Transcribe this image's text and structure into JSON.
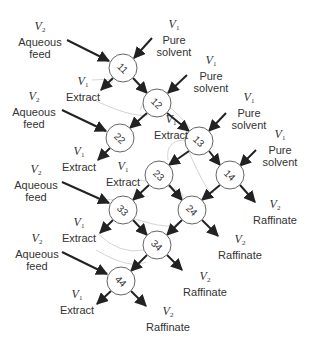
{
  "diagram": {
    "type": "cross-current extraction cascade",
    "colors": {
      "arrow": "#222222",
      "node_stroke": "#666666",
      "curve": "#cccccc",
      "text": "#333333"
    },
    "nodes": [
      {
        "id": "11",
        "label": "11",
        "x": 123,
        "y": 68
      },
      {
        "id": "12",
        "label": "12",
        "x": 157,
        "y": 103
      },
      {
        "id": "13",
        "label": "13",
        "x": 199,
        "y": 141
      },
      {
        "id": "14",
        "label": "14",
        "x": 230,
        "y": 175
      },
      {
        "id": "22",
        "label": "22",
        "x": 120,
        "y": 138
      },
      {
        "id": "23",
        "label": "23",
        "x": 159,
        "y": 175
      },
      {
        "id": "24",
        "label": "24",
        "x": 192,
        "y": 210
      },
      {
        "id": "33",
        "label": "33",
        "x": 123,
        "y": 210
      },
      {
        "id": "34",
        "label": "34",
        "x": 157,
        "y": 245
      },
      {
        "id": "44",
        "label": "44",
        "x": 121,
        "y": 281
      }
    ],
    "labels": {
      "aqueous_feed_1": {
        "var": "V",
        "sub": "2",
        "line1": "Aqueous",
        "line2": "feed"
      },
      "aqueous_feed_2": {
        "var": "V",
        "sub": "2",
        "line1": "Aqueous",
        "line2": "feed"
      },
      "aqueous_feed_3": {
        "var": "V",
        "sub": "2",
        "line1": "Aqueous",
        "line2": "feed"
      },
      "aqueous_feed_4": {
        "var": "V",
        "sub": "2",
        "line1": "Aqueous",
        "line2": "feed"
      },
      "pure_solvent_1": {
        "var": "V",
        "sub": "1",
        "line1": "Pure",
        "line2": "solvent"
      },
      "pure_solvent_2": {
        "var": "V",
        "sub": "1",
        "line1": "Pure",
        "line2": "solvent"
      },
      "pure_solvent_3": {
        "var": "V",
        "sub": "1",
        "line1": "Pure",
        "line2": "solvent"
      },
      "pure_solvent_4": {
        "var": "V",
        "sub": "1",
        "line1": "Pure",
        "line2": "solvent"
      },
      "extract_1": {
        "var": "V",
        "sub": "1",
        "line1": "Extract"
      },
      "extract_2": {
        "var": "V",
        "sub": "1",
        "line1": "Extract"
      },
      "extract_3": {
        "var": "V",
        "sub": "1",
        "line1": "Extract"
      },
      "extract_4": {
        "var": "V",
        "sub": "1",
        "line1": "Extract"
      },
      "extract_5": {
        "var": "V",
        "sub": "1",
        "line1": "Extract"
      },
      "extract_6": {
        "var": "V",
        "sub": "1",
        "line1": "Extract"
      },
      "raffinate_1": {
        "var": "V",
        "sub": "2",
        "line1": "Raffinate"
      },
      "raffinate_2": {
        "var": "V",
        "sub": "2",
        "line1": "Raffinate"
      },
      "raffinate_3": {
        "var": "V",
        "sub": "2",
        "line1": "Raffinate"
      },
      "raffinate_4": {
        "var": "V",
        "sub": "2",
        "line1": "Raffinate"
      }
    }
  }
}
